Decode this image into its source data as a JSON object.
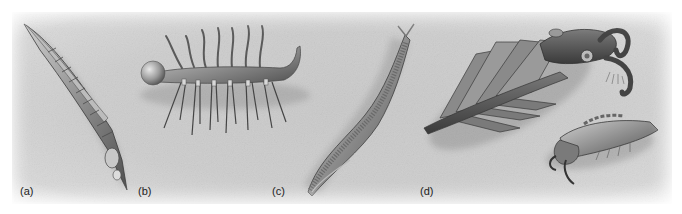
{
  "figure": {
    "panels": [
      {
        "id": "a",
        "label": "(a)",
        "subject": "elongated segmented arthropod with carapace"
      },
      {
        "id": "b",
        "label": "(b)",
        "subject": "lobopodian worm with dorsal tentacles and ventral spines"
      },
      {
        "id": "c",
        "label": "(c)",
        "subject": "slender chordate-like swimming animal with myomere stripes"
      },
      {
        "id": "d",
        "label": "(d)",
        "subject": "large anomalocaridid with frontal appendages and small arthropod"
      }
    ],
    "colors": {
      "background": "#cbcbcb",
      "page": "#ffffff",
      "ink": "#222222",
      "body_mid": "#8a8a8a",
      "body_dark": "#4a4a4a",
      "body_light": "#bdbdbd"
    }
  }
}
